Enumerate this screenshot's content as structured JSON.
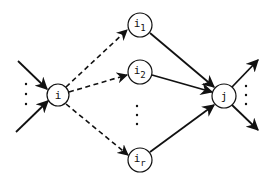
{
  "diagram": {
    "type": "flow-graph",
    "colors": {
      "stroke": "#111111",
      "background": "#ffffff"
    },
    "nodes": [
      {
        "id": "i",
        "label": "i",
        "sub": "",
        "cx": 58,
        "cy": 95,
        "r": 11
      },
      {
        "id": "i1",
        "label": "i",
        "sub": "1",
        "cx": 140,
        "cy": 25,
        "r": 12
      },
      {
        "id": "i2",
        "label": "i",
        "sub": "2",
        "cx": 140,
        "cy": 72,
        "r": 12
      },
      {
        "id": "ir",
        "label": "i",
        "sub": "r",
        "cx": 140,
        "cy": 160,
        "r": 12
      },
      {
        "id": "j",
        "label": "j",
        "sub": "",
        "cx": 224,
        "cy": 96,
        "r": 12
      }
    ],
    "edges": [
      {
        "from": "in-top",
        "to": "i",
        "style": "solid"
      },
      {
        "from": "in-bottom",
        "to": "i",
        "style": "solid"
      },
      {
        "from": "i",
        "to": "i1",
        "style": "dashed"
      },
      {
        "from": "i",
        "to": "i2",
        "style": "dashed"
      },
      {
        "from": "i",
        "to": "ir",
        "style": "dashed"
      },
      {
        "from": "i1",
        "to": "j",
        "style": "solid"
      },
      {
        "from": "i2",
        "to": "j",
        "style": "solid"
      },
      {
        "from": "ir",
        "to": "j",
        "style": "solid"
      },
      {
        "from": "j",
        "to": "out-top",
        "style": "solid"
      },
      {
        "from": "j",
        "to": "out-bottom",
        "style": "solid"
      }
    ],
    "ellipses": [
      "left-vertical-dots",
      "middle-vertical-dots",
      "right-vertical-dots"
    ],
    "labels": {
      "i": "i",
      "i1_main": "i",
      "i1_sub": "1",
      "i2_main": "i",
      "i2_sub": "2",
      "ir_main": "i",
      "ir_sub": "r",
      "j": "j"
    }
  }
}
